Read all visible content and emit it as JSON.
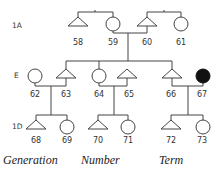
{
  "generations": [
    {
      "label": "1A"
    },
    {
      "label": "E"
    },
    {
      "label": "1D"
    }
  ],
  "individuals": [
    {
      "id": "58",
      "sex": "male",
      "shape": "triangle",
      "affected": false
    },
    {
      "id": "59",
      "sex": "female",
      "shape": "circle",
      "affected": false
    },
    {
      "id": "60",
      "sex": "male",
      "shape": "triangle",
      "affected": false
    },
    {
      "id": "61",
      "sex": "female",
      "shape": "circle",
      "affected": false
    },
    {
      "id": "62",
      "sex": "female",
      "shape": "circle",
      "affected": false
    },
    {
      "id": "63",
      "sex": "male",
      "shape": "triangle",
      "affected": false
    },
    {
      "id": "64",
      "sex": "female",
      "shape": "circle",
      "affected": false
    },
    {
      "id": "65",
      "sex": "male",
      "shape": "triangle",
      "affected": false
    },
    {
      "id": "66",
      "sex": "male",
      "shape": "triangle",
      "affected": false
    },
    {
      "id": "67",
      "sex": "female",
      "shape": "circle",
      "affected": true
    },
    {
      "id": "68",
      "sex": "male",
      "shape": "triangle",
      "affected": false
    },
    {
      "id": "69",
      "sex": "female",
      "shape": "circle",
      "affected": false
    },
    {
      "id": "70",
      "sex": "male",
      "shape": "triangle",
      "affected": false
    },
    {
      "id": "71",
      "sex": "female",
      "shape": "circle",
      "affected": false
    },
    {
      "id": "72",
      "sex": "male",
      "shape": "triangle",
      "affected": false
    },
    {
      "id": "73",
      "sex": "female",
      "shape": "circle",
      "affected": false
    }
  ],
  "colors": {
    "line": "#444444",
    "affected_fill": "#111111"
  },
  "captions": {
    "generation": "Generation",
    "number": "Number",
    "term": "Term"
  }
}
